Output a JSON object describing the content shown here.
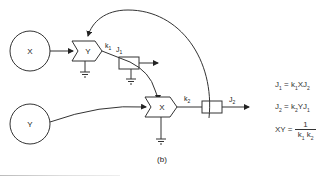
{
  "diagram": {
    "caption": "(b)",
    "nodes": {
      "source_x": {
        "label": "X"
      },
      "source_y": {
        "label": "Y"
      },
      "enzyme_y": {
        "label": "Y"
      },
      "enzyme_x": {
        "label": "X"
      }
    },
    "edge_labels": {
      "k1": "k",
      "k1_sub": "1",
      "j1": "J",
      "j1_sub": "1",
      "k2": "k",
      "k2_sub": "2",
      "j2": "J",
      "j2_sub": "2"
    },
    "equations": {
      "eq1": {
        "lhs": "J",
        "lhs_sub": "1",
        "op": "=",
        "rhs_a": "k",
        "rhs_a_sub": "1",
        "rhs_b": "XJ",
        "rhs_b_sub": "2"
      },
      "eq2": {
        "lhs": "J",
        "lhs_sub": "2",
        "op": "=",
        "rhs_a": "k",
        "rhs_a_sub": "2",
        "rhs_b": "YJ",
        "rhs_b_sub": "1"
      },
      "eq3": {
        "lhs": "XY",
        "op": "=",
        "numerator": "1",
        "den_a": "k",
        "den_a_sub": "1",
        "den_b": "k",
        "den_b_sub": "2"
      }
    }
  }
}
